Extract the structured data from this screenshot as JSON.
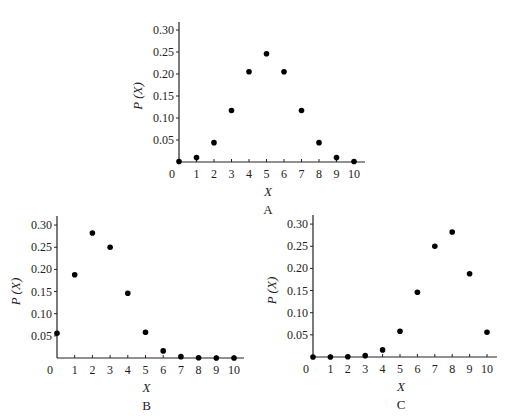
{
  "chart_data": [
    {
      "type": "scatter",
      "caption": "A",
      "xlabel": "X",
      "ylabel": "P (X)",
      "x": [
        0,
        1,
        2,
        3,
        4,
        5,
        6,
        7,
        8,
        9,
        10
      ],
      "values": [
        0.001,
        0.01,
        0.044,
        0.117,
        0.205,
        0.246,
        0.205,
        0.117,
        0.044,
        0.01,
        0.001
      ],
      "xticks": [
        "0",
        "1",
        "2",
        "3",
        "4",
        "5",
        "6",
        "7",
        "8",
        "9",
        "10"
      ],
      "yticks": [
        "0.05",
        "0.10",
        "0.15",
        "0.20",
        "0.25",
        "0.30"
      ],
      "ylim": [
        0,
        0.32
      ],
      "grid": false,
      "geom": {
        "x0": 179,
        "y0": 162,
        "dx": 17.5,
        "pxPerUnit": 440,
        "top": 22,
        "right": 365
      }
    },
    {
      "type": "scatter",
      "caption": "B",
      "xlabel": "X",
      "ylabel": "P (X)",
      "x": [
        0,
        1,
        2,
        3,
        4,
        5,
        6,
        7,
        8,
        9,
        10
      ],
      "values": [
        0.056,
        0.188,
        0.282,
        0.25,
        0.146,
        0.058,
        0.016,
        0.003,
        0.0004,
        3e-05,
        1e-06
      ],
      "xticks": [
        "0",
        "1",
        "2",
        "3",
        "4",
        "5",
        "6",
        "7",
        "8",
        "9",
        "10"
      ],
      "yticks": [
        "0.05",
        "0.10",
        "0.15",
        "0.20",
        "0.25",
        "0.30"
      ],
      "ylim": [
        0,
        0.32
      ],
      "grid": false,
      "geom": {
        "x0": 57,
        "y0": 358,
        "dx": 17.7,
        "pxPerUnit": 443,
        "top": 216,
        "right": 244
      }
    },
    {
      "type": "scatter",
      "caption": "C",
      "xlabel": "X",
      "ylabel": "P (X)",
      "x": [
        0,
        1,
        2,
        3,
        4,
        5,
        6,
        7,
        8,
        9,
        10
      ],
      "values": [
        1e-06,
        3e-05,
        0.0004,
        0.003,
        0.016,
        0.058,
        0.146,
        0.25,
        0.282,
        0.188,
        0.056
      ],
      "xticks": [
        "0",
        "1",
        "2",
        "3",
        "4",
        "5",
        "6",
        "7",
        "8",
        "9",
        "10"
      ],
      "yticks": [
        "0.05",
        "0.10",
        "0.15",
        "0.20",
        "0.25",
        "0.30"
      ],
      "ylim": [
        0,
        0.32
      ],
      "grid": false,
      "geom": {
        "x0": 313,
        "y0": 357,
        "dx": 17.4,
        "pxPerUnit": 443,
        "top": 215,
        "right": 497
      }
    }
  ]
}
